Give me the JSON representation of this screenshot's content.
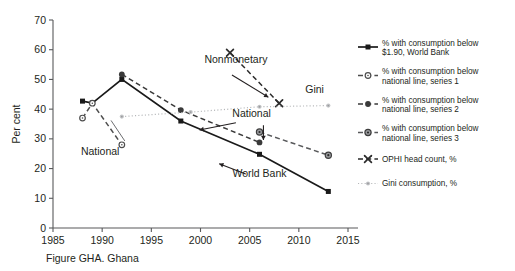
{
  "caption": "Figure GHA. Ghana",
  "axes": {
    "ylabel": "Per cent",
    "ylim": [
      0,
      70
    ],
    "yticks": [
      "0",
      "10",
      "20",
      "30",
      "40",
      "50",
      "60",
      "70"
    ],
    "xlim": [
      1985,
      2015
    ],
    "xticks": [
      "1985",
      "1990",
      "1995",
      "2000",
      "2005",
      "2010",
      "2015"
    ],
    "axis_color": "#58595b",
    "grid": false
  },
  "annotations": [
    {
      "id": "ann-national-left",
      "text": "National",
      "x": 1989.8,
      "y": 24.5
    },
    {
      "id": "ann-nonmonetary",
      "text": "Nonmonetary",
      "x": 2003.6,
      "y": 55.5
    },
    {
      "id": "ann-national-right",
      "text": "National",
      "x": 2005.2,
      "y": 37.5
    },
    {
      "id": "ann-gini",
      "text": "Gini",
      "x": 2011.6,
      "y": 45.5
    },
    {
      "id": "ann-world-bank",
      "text": "World Bank",
      "x": 2006.0,
      "y": 17.0
    }
  ],
  "legend": {
    "position": "right",
    "items": [
      {
        "marker": "square-filled",
        "color": "#1a1a1a",
        "line": "solid",
        "label": "% with consumption below $1.90, World Bank"
      },
      {
        "marker": "circle-open",
        "color": "#4d4d4d",
        "line": "dashed",
        "label": "% with consumption below national line, series 1"
      },
      {
        "marker": "circle-filled",
        "color": "#3a3a3a",
        "line": "dashed",
        "label": "% with consumption below national line, series 2"
      },
      {
        "marker": "circle-dot",
        "color": "#58595b",
        "line": "dashed",
        "label": "% with consumption below national line, series 3"
      },
      {
        "marker": "x-cross",
        "color": "#2b2b2b",
        "line": "dashed",
        "label": "OPHI head count, %"
      },
      {
        "marker": "dot-small",
        "color": "#b5b7b9",
        "line": "dotted",
        "label": "Gini consumption, %"
      }
    ]
  },
  "chart_data": {
    "type": "line",
    "title": "Figure GHA. Ghana",
    "xlabel": "",
    "ylabel": "Per cent",
    "xlim": [
      1985,
      2015
    ],
    "ylim": [
      0,
      70
    ],
    "series": [
      {
        "name": "% with consumption below $1.90, World Bank",
        "marker": "square-filled",
        "line": "solid",
        "color": "#1a1a1a",
        "points": [
          {
            "x": 1988,
            "y": 42.7
          },
          {
            "x": 1989,
            "y": 42.0
          },
          {
            "x": 1992,
            "y": 50.0
          },
          {
            "x": 1998,
            "y": 36.0
          },
          {
            "x": 2006,
            "y": 24.8
          },
          {
            "x": 2013,
            "y": 12.3
          }
        ]
      },
      {
        "name": "% with consumption below national line, series 1",
        "marker": "circle-open",
        "line": "dashed",
        "color": "#4d4d4d",
        "points": [
          {
            "x": 1988,
            "y": 37.0
          },
          {
            "x": 1989,
            "y": 42.0
          },
          {
            "x": 1992,
            "y": 28.0
          }
        ]
      },
      {
        "name": "% with consumption below national line, series 2",
        "marker": "circle-filled",
        "line": "dashed",
        "color": "#3a3a3a",
        "points": [
          {
            "x": 1992,
            "y": 51.7
          },
          {
            "x": 1998,
            "y": 39.7
          },
          {
            "x": 2006,
            "y": 28.8
          }
        ]
      },
      {
        "name": "% with consumption below national line, series 3",
        "marker": "circle-dot",
        "line": "dashed",
        "color": "#58595b",
        "points": [
          {
            "x": 2006,
            "y": 32.3
          },
          {
            "x": 2013,
            "y": 24.5
          }
        ]
      },
      {
        "name": "OPHI head count, %",
        "marker": "x-cross",
        "line": "dashed",
        "color": "#2b2b2b",
        "points": [
          {
            "x": 2003,
            "y": 59.0
          },
          {
            "x": 2008,
            "y": 42.0
          }
        ]
      },
      {
        "name": "Gini consumption, %",
        "marker": "dot-small",
        "line": "dotted",
        "color": "#b5b7b9",
        "points": [
          {
            "x": 1992,
            "y": 37.5
          },
          {
            "x": 1999,
            "y": 39.0
          },
          {
            "x": 2006,
            "y": 40.8
          },
          {
            "x": 2013,
            "y": 41.2
          }
        ]
      }
    ]
  }
}
